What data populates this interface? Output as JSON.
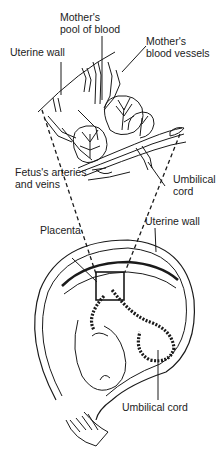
{
  "labels": {
    "mothers_pool": [
      "Mother's",
      "pool of blood"
    ],
    "uterine_wall_top": "Uterine wall",
    "mothers_vessels": [
      "Mother's",
      "blood vessels"
    ],
    "fetus_arteries": [
      "Fetus's arteries",
      "and veins"
    ],
    "umbilical_cord_top": [
      "Umbilical",
      "cord"
    ],
    "placenta": "Placenta",
    "uterine_wall_bottom": "Uterine wall",
    "umbilical_cord_bottom": "Umbilical cord"
  },
  "colors": {
    "ink": "#1a1a1a",
    "background": "#ffffff"
  }
}
